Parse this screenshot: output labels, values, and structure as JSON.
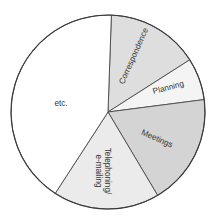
{
  "chart_data": {
    "type": "pie",
    "title": "",
    "start_angle_deg": 2,
    "direction": "clockwise",
    "legend": "none (labels inside slices)",
    "center": [
      108,
      112
    ],
    "radius": 97,
    "slices": [
      {
        "label": "Correspondence",
        "percent": 15.4,
        "color": "#dedede",
        "label_rotation": -66
      },
      {
        "label": "Planning",
        "percent": 7.0,
        "color": "#f4f4f4",
        "label_rotation": -20
      },
      {
        "label": "Meetings",
        "percent": 18.5,
        "color": "#d4d4d4",
        "label_rotation": 24
      },
      {
        "label": "Telephoning/ e-mailing",
        "percent": 17.7,
        "color": "#ebebeb",
        "label_rotation": 90
      },
      {
        "label": "etc.",
        "percent": 41.4,
        "color": "#ffffff",
        "label_rotation": 0
      }
    ],
    "categories": [
      "Correspondence",
      "Planning",
      "Meetings",
      "Telephoning/ e-mailing",
      "etc."
    ],
    "values": [
      15.4,
      7.0,
      18.5,
      17.7,
      41.4
    ]
  },
  "labels": {
    "correspondence": "Correspondence",
    "planning": "Planning",
    "meetings": "Meetings",
    "telephoning_line1": "Telephoning/",
    "telephoning_line2": "e-mailing",
    "etc": "etc."
  }
}
